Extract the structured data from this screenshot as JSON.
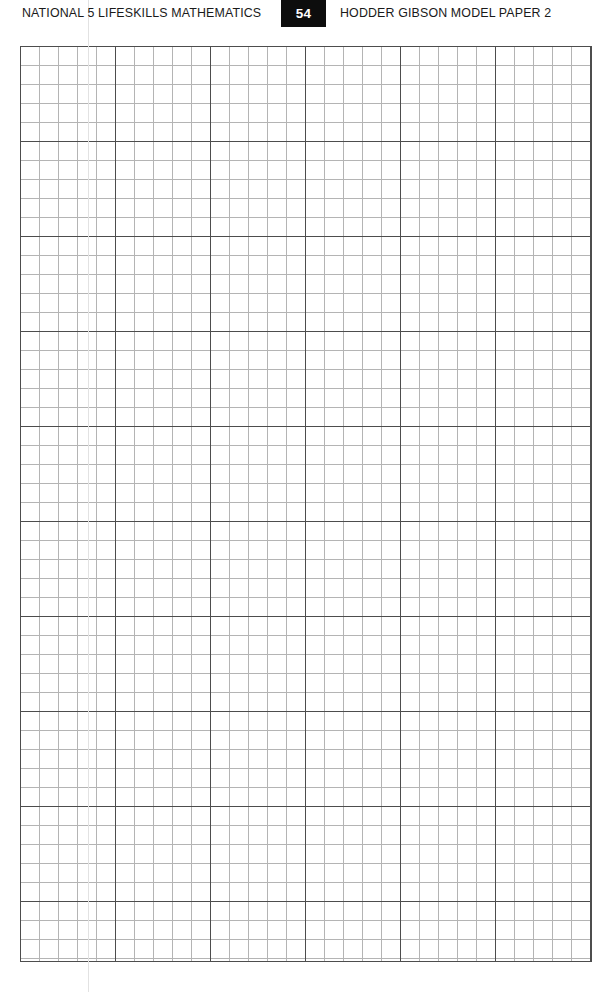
{
  "page": {
    "width": 615,
    "height": 992,
    "background_color": "#ffffff"
  },
  "header": {
    "left_text": "NATIONAL 5 LIFESKILLS MATHEMATICS",
    "page_number": "54",
    "right_text": "HODDER GIBSON MODEL PAPER 2",
    "page_number_box_color": "#0d0d0d",
    "page_number_text_color": "#ffffff",
    "text_color": "#1a1a1a"
  },
  "grid": {
    "label": "blank graph paper answer space",
    "left": 20,
    "top": 46,
    "width": 572,
    "height": 916,
    "minor_cell_px": 19,
    "major_cell_px": 95,
    "cells_per_major": 5,
    "minor_columns": 30,
    "minor_rows": 48,
    "major_columns": 6,
    "major_rows": 9,
    "minor_line_color": "#b4b4b4",
    "major_line_color": "#4d4d4d",
    "frame_color": "#4d4d4d"
  },
  "artifacts": {
    "fold_line_label": "page fold scan line",
    "fold_line_x": 88,
    "fold_line_color": "#e2e2e2"
  }
}
